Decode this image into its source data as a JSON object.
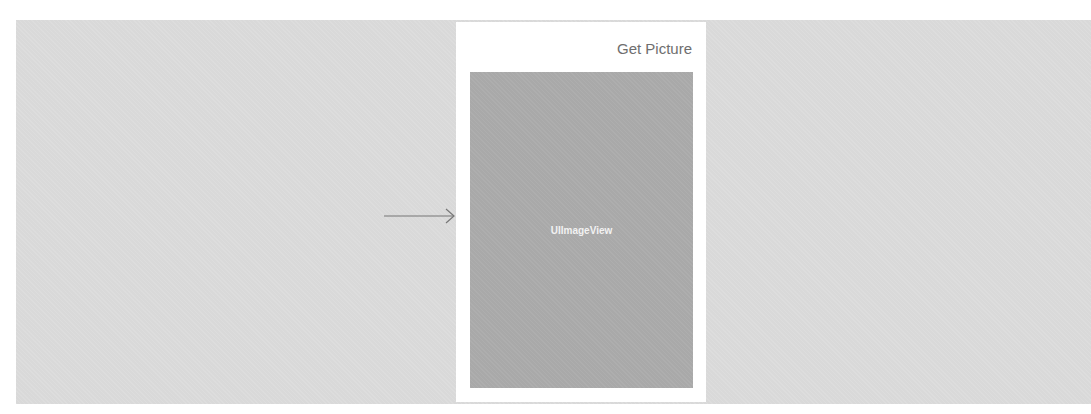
{
  "storyboard": {
    "entry_arrow": "arrow-right-icon",
    "view_controller": {
      "nav_button_label": "Get Picture",
      "image_view_label": "UIImageView"
    }
  },
  "colors": {
    "canvas": "#d9d9d9",
    "device": "#ffffff",
    "image_view": "#a9a9a9",
    "nav_button": "#6e6e6e"
  }
}
